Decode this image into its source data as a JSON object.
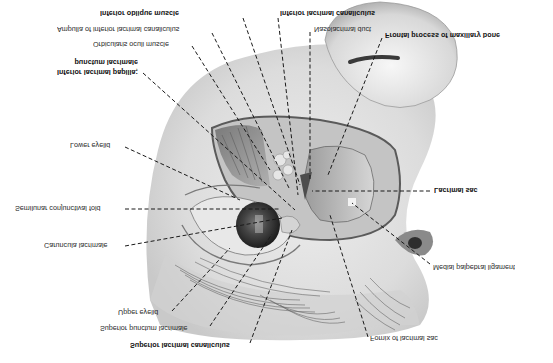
{
  "figure": {
    "orientation": "vertically-flipped"
  },
  "labels": {
    "inferior_oblique_muscle": "Inferior oblique muscle",
    "ampulla_inferior_canaliculus": "Ampulla of inferior lacrimal canaliculus",
    "orbicularis_oculi": "Orbicularis oculi muscle",
    "inferior_papilla_line1": "Inferior lacrimal papilla;",
    "inferior_papilla_line2": "punctum lacrimale",
    "lower_eyelid": "Lower eyelid",
    "semilunar_fold": "Semilunar conjunctival fold",
    "caruncula": "Caruncula lacrimale",
    "upper_eyelid": "Upper eyelid",
    "superior_punctum": "Superior punctum lacrimale",
    "superior_canaliculus": "Superior lacrimal canaliculus",
    "inferior_canaliculus": "Inferior lacrimal canaliculus",
    "nasolacrimal_duct": "Nasolacrimal duct",
    "frontal_process": "Frontal process of maxillary bone",
    "lacrimal_sac": "Lacrimal sac",
    "medial_palpebral_ligament": "Medial palpebral ligament",
    "fornix_lacrimal_sac": "Fornix of lacrimal sac"
  },
  "colors": {
    "background": "#ffffff",
    "skin_light": "#e8e8e8",
    "skin_mid": "#cfcfcf",
    "shadow": "#6a6a6a",
    "leader_line": "#1a1a1a",
    "iris": "#3a3a3a"
  }
}
